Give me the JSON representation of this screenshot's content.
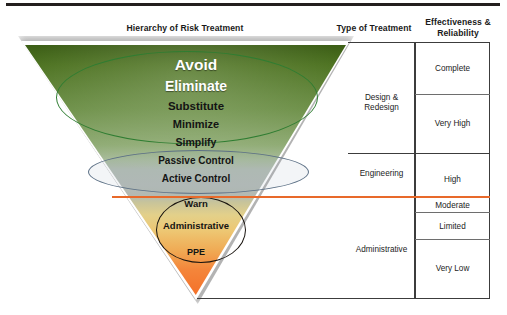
{
  "headers": {
    "hierarchy": "Hierarchy of Risk Treatment",
    "type": "Type of Treatment",
    "effectiveness": "Effectiveness &\nReliability",
    "effectiveness_line1": "Effectiveness &",
    "effectiveness_line2": "Reliability"
  },
  "pyramid": {
    "levels": [
      {
        "label": "Avoid",
        "zone": "design",
        "size": 15.5
      },
      {
        "label": "Eliminate",
        "zone": "design",
        "size": 14.0
      },
      {
        "label": "Substitute",
        "zone": "design",
        "size": 11.5
      },
      {
        "label": "Minimize",
        "zone": "design",
        "size": 11.0
      },
      {
        "label": "Simplify",
        "zone": "design",
        "size": 10.5
      },
      {
        "label": "Passive Control",
        "zone": "engineering",
        "size": 10.0
      },
      {
        "label": "Active Control",
        "zone": "engineering",
        "size": 10.0
      },
      {
        "label": "Warn",
        "zone": "administrative",
        "size": 9.5
      },
      {
        "label": "Administrative",
        "zone": "administrative",
        "size": 9.5
      },
      {
        "label": "PPE",
        "zone": "administrative",
        "size": 9.0
      }
    ]
  },
  "type_of_treatment": [
    {
      "label": "Design & Redesign"
    },
    {
      "label": "Engineering"
    },
    {
      "label": "Administrative"
    }
  ],
  "effectiveness": [
    {
      "label": "Complete"
    },
    {
      "label": "Very High"
    },
    {
      "label": "High"
    },
    {
      "label": "Moderate"
    },
    {
      "label": "Limited"
    },
    {
      "label": "Very Low"
    }
  ],
  "colors": {
    "top_rule": "#231f1e",
    "orange_rule": "#e8692a",
    "green_ellipse": "#2f7d32",
    "gray_ellipse": "#5d7186",
    "circle_outline": "#19140f",
    "table_border": "#3c3c3c",
    "gradient_top": "#3c5e16",
    "gradient_mid": "#b3bdb4",
    "gradient_bottom": "#f4712a"
  }
}
